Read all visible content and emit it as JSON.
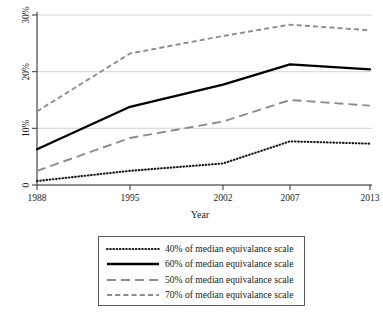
{
  "chart_data": {
    "type": "line",
    "title": "",
    "xlabel": "Year",
    "ylabel": "",
    "x": [
      1988,
      1995,
      2002,
      2007,
      2013
    ],
    "xtick_labels": [
      "1988",
      "1995",
      "2002",
      "2007",
      "2013"
    ],
    "ytick_labels": [
      "0",
      "10%",
      "20%",
      "30%"
    ],
    "ytick_values": [
      0,
      10,
      20,
      30
    ],
    "ylim": [
      0,
      30
    ],
    "xlim": [
      1988,
      2013
    ],
    "grid": "horizontal",
    "legend_position": "below-plot",
    "series": [
      {
        "name": "40% of median equivalance scale",
        "style": "dotted",
        "color": "#1a1a1a",
        "values": [
          0.7,
          2.5,
          3.8,
          7.7,
          7.3
        ]
      },
      {
        "name": "60% of median equivalance scale",
        "style": "solid",
        "color": "#000000",
        "values": [
          6.3,
          13.8,
          17.7,
          21.3,
          20.4
        ]
      },
      {
        "name": "50% of median equivalance scale",
        "style": "long-dash",
        "color": "#8c8c8c",
        "values": [
          2.5,
          8.3,
          11.2,
          15.0,
          14.0
        ]
      },
      {
        "name": "70% of median equivalance scale",
        "style": "short-dash",
        "color": "#8c8c8c",
        "values": [
          13.0,
          23.2,
          26.3,
          28.3,
          27.3
        ]
      }
    ]
  },
  "axes": {
    "x_title": "Year",
    "x_ticks": [
      "1988",
      "1995",
      "2002",
      "2007",
      "2013"
    ],
    "y_ticks": [
      "0",
      "10%",
      "20%",
      "30%"
    ]
  },
  "legend": {
    "items": [
      {
        "label": "40% of median equivalance scale",
        "style": "dotted"
      },
      {
        "label": "60% of median equivalance scale",
        "style": "solid"
      },
      {
        "label": "50% of median equivalance scale",
        "style": "long-dash"
      },
      {
        "label": "70% of median equivalance scale",
        "style": "short-dash"
      }
    ]
  },
  "colors": {
    "black": "#000000",
    "gray": "#8c8c8c",
    "grid": "#c9c9c9",
    "axis": "#333333"
  }
}
